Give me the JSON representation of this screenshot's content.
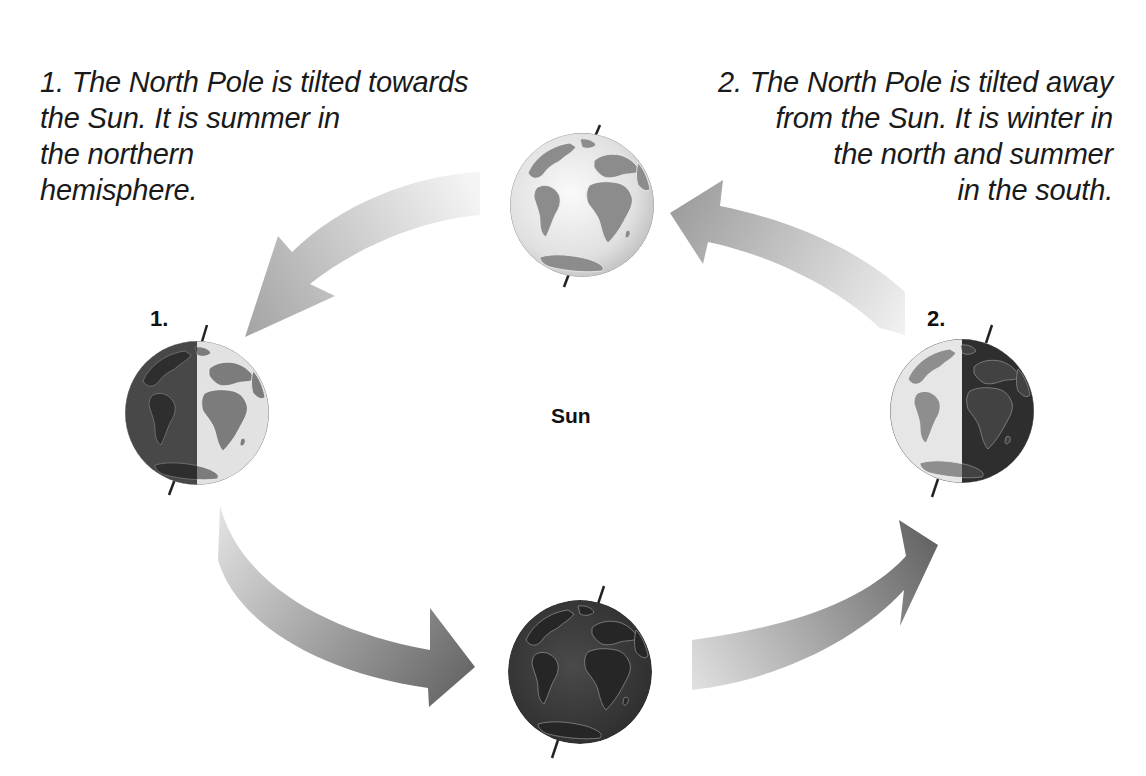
{
  "diagram": {
    "center_label": "Sun",
    "captions": [
      {
        "id": "1",
        "lines": [
          "1. The North Pole is tilted towards",
          "the Sun. It is summer in",
          "the northern",
          "hemisphere."
        ]
      },
      {
        "id": "2",
        "lines": [
          "2. The North Pole is tilted away",
          "from the Sun. It is winter in",
          "the north and summer",
          "in the south."
        ]
      }
    ],
    "globes": [
      {
        "position": "top",
        "label": "",
        "lighting": "fully-lit"
      },
      {
        "position": "left",
        "label": "1.",
        "lighting": "right-half-lit"
      },
      {
        "position": "right",
        "label": "2.",
        "lighting": "left-half-lit"
      },
      {
        "position": "bottom",
        "label": "",
        "lighting": "dark"
      }
    ],
    "arrows": [
      {
        "from": "top",
        "to": "left",
        "direction": "counter-clockwise"
      },
      {
        "from": "left",
        "to": "bottom",
        "direction": "counter-clockwise"
      },
      {
        "from": "bottom",
        "to": "right",
        "direction": "counter-clockwise"
      },
      {
        "from": "right",
        "to": "top",
        "direction": "counter-clockwise"
      }
    ],
    "colors": {
      "ocean_light": "#e8e8e8",
      "land_light": "#8a8a8a",
      "ocean_dark": "#3a3a3a",
      "land_dark": "#2a2a2a",
      "arrow_dark": "#6e6e6e",
      "arrow_light": "#eeeeee",
      "text": "#1a1a1a"
    }
  }
}
